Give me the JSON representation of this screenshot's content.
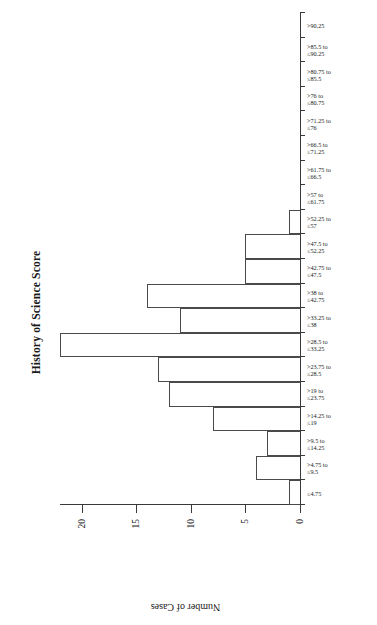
{
  "chart_data": {
    "type": "bar",
    "title": "History of Science Score",
    "xlabel": "",
    "ylabel": "Number of Cases",
    "orientation": "rotated-90-ccw",
    "grid": false,
    "legend": null,
    "ylim": [
      0,
      22
    ],
    "yticks": [
      "0",
      "5",
      "10",
      "15",
      "20"
    ],
    "ytick_values": [
      0,
      5,
      10,
      15,
      20
    ],
    "categories": [
      "≤4.75",
      ">4.75 to ≤9.5",
      ">9.5 to ≤14.25",
      ">14.25 to ≤19",
      ">19 to ≤23.75",
      ">23.75 to ≤28.5",
      ">28.5 to ≤33.25",
      ">33.25 to ≤38",
      ">38 to ≤42.75",
      ">42.75 to ≤47.5",
      ">47.5 to ≤52.25",
      ">52.25 to ≤57",
      ">57 to ≤61.75",
      ">61.75 to ≤66.5",
      ">66.5 to ≤71.25",
      ">71.25 to ≤76",
      ">76 to ≤80.75",
      ">80.75 to ≤85.5",
      ">85.5 to ≤90.25",
      ">90.25"
    ],
    "category_lines": [
      [
        "≤4.75",
        ""
      ],
      [
        ">4.75 to",
        "≤9.5"
      ],
      [
        ">9.5 to",
        "≤14.25"
      ],
      [
        ">14.25 to",
        "≤19"
      ],
      [
        ">19 to",
        "≤23.75"
      ],
      [
        ">23.75 to",
        "≤28.5"
      ],
      [
        ">28.5 to",
        "≤33.25"
      ],
      [
        ">33.25 to",
        "≤38"
      ],
      [
        ">38 to",
        "≤42.75"
      ],
      [
        ">42.75 to",
        "≤47.5"
      ],
      [
        ">47.5 to",
        "≤52.25"
      ],
      [
        ">52.25 to",
        "≤57"
      ],
      [
        ">57 to",
        "≤61.75"
      ],
      [
        ">61.75 to",
        "≤66.5"
      ],
      [
        ">66.5 to",
        "≤71.25"
      ],
      [
        ">71.25 to",
        "≤76"
      ],
      [
        ">76 to",
        "≤80.75"
      ],
      [
        ">80.75 to",
        "≤85.5"
      ],
      [
        ">85.5 to",
        "≤90.25"
      ],
      [
        ">90.25",
        ""
      ]
    ],
    "values": [
      1,
      4,
      3,
      8,
      12,
      13,
      22,
      11,
      14,
      5,
      5,
      1,
      0,
      0,
      0,
      0,
      0,
      0,
      0,
      0
    ],
    "bar_fill": "#ffffff",
    "bar_edge": "#4a4a4a",
    "axis_color": "#3a3a3a",
    "background": "#ffffff"
  }
}
